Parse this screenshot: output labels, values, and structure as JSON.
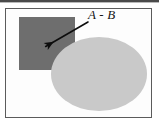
{
  "figure": {
    "kind": "set-difference-venn-diagram",
    "background_color": "#ffffff",
    "frame": {
      "border_color": "#5b5b5b",
      "fill_color": "#fdfdfd",
      "x": 5,
      "y": 8,
      "width": 147,
      "height": 110
    },
    "top_rule": {
      "color": "#4a4a4a",
      "x": 0,
      "y": 0,
      "width": 159,
      "height": 2
    }
  },
  "annotation": {
    "label": "A - B",
    "label_color": "#161616",
    "label_x": 88,
    "label_y": 8,
    "leader_line_color": "#0d0d0d"
  },
  "arrow": {
    "from_x": 88,
    "from_y": 22,
    "to_x": 50,
    "to_y": 44,
    "color": "#0d0d0d",
    "stroke_width": 1.6
  },
  "shapes": [
    {
      "name": "set-a-rectangle",
      "role": "set A",
      "type": "rect",
      "fill": "#6e6e6e",
      "x": 19,
      "y": 17,
      "width": 56,
      "height": 53
    },
    {
      "name": "set-b-ellipse",
      "role": "set B",
      "type": "ellipse",
      "fill": "#c9c9c9",
      "cx": 99,
      "cy": 74,
      "rx": 48,
      "ry": 37
    }
  ],
  "chart_data": {
    "type": "diagram",
    "title": "A - B",
    "regions": [
      {
        "label": "A",
        "shape": "rectangle",
        "fill": "#6e6e6e"
      },
      {
        "label": "B",
        "shape": "ellipse",
        "fill": "#c9c9c9"
      },
      {
        "label": "A - B",
        "shape": "rectangle-minus-ellipse",
        "fill": "#6e6e6e"
      }
    ],
    "annotations": [
      {
        "text": "A - B",
        "points_to": "rectangle region outside the ellipse"
      }
    ]
  }
}
